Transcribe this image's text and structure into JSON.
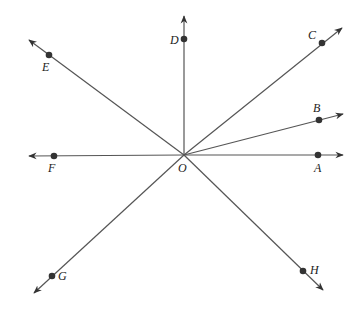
{
  "diagram": {
    "type": "rays-from-common-endpoint",
    "origin": {
      "label": "O",
      "x": 184,
      "y": 155,
      "label_x": 178,
      "label_y": 172
    },
    "colors": {
      "line": "#555555",
      "point": "#333333",
      "label": "#222222",
      "background": "#ffffff"
    },
    "rays": [
      {
        "label": "A",
        "point": {
          "x": 318,
          "y": 155
        },
        "tip": {
          "x": 343,
          "y": 155
        },
        "label_pos": {
          "x": 314,
          "y": 172
        }
      },
      {
        "label": "B",
        "point": {
          "x": 319,
          "y": 120
        },
        "tip": {
          "x": 343,
          "y": 114
        },
        "label_pos": {
          "x": 313,
          "y": 112
        }
      },
      {
        "label": "C",
        "point": {
          "x": 322,
          "y": 43
        },
        "tip": {
          "x": 342,
          "y": 28
        },
        "label_pos": {
          "x": 308,
          "y": 39
        }
      },
      {
        "label": "D",
        "point": {
          "x": 184,
          "y": 39
        },
        "tip": {
          "x": 184,
          "y": 16
        },
        "label_pos": {
          "x": 170,
          "y": 44
        }
      },
      {
        "label": "E",
        "point": {
          "x": 49,
          "y": 55
        },
        "tip": {
          "x": 29,
          "y": 40
        },
        "label_pos": {
          "x": 42,
          "y": 71
        }
      },
      {
        "label": "F",
        "point": {
          "x": 54,
          "y": 156
        },
        "tip": {
          "x": 29,
          "y": 156
        },
        "label_pos": {
          "x": 48,
          "y": 172
        }
      },
      {
        "label": "G",
        "point": {
          "x": 52,
          "y": 276
        },
        "tip": {
          "x": 34,
          "y": 293
        },
        "label_pos": {
          "x": 58,
          "y": 280
        }
      },
      {
        "label": "H",
        "point": {
          "x": 303,
          "y": 271
        },
        "tip": {
          "x": 323,
          "y": 290
        },
        "label_pos": {
          "x": 310,
          "y": 274
        }
      }
    ]
  }
}
